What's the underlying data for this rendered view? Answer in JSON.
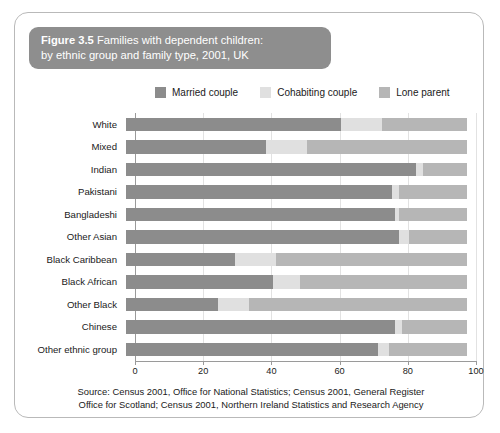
{
  "figure": {
    "number": "Figure 3.5",
    "title_line1": " Families with dependent children:",
    "title_line2": "by ethnic group and family type, 2001, UK",
    "band_color": "#8e8e8e",
    "card_border_color": "#b9b9b9"
  },
  "source": {
    "line1": "Source: Census 2001, Office for National Statistics; Census 2001, General Register",
    "line2": "Office for Scotland; Census 2001, Northern Ireland Statistics and Research Agency"
  },
  "chart_data": {
    "type": "bar",
    "orientation": "horizontal",
    "stacked": true,
    "stack_mode": "percent",
    "title": "Figure 3.5 Families with dependent children: by ethnic group and family type, 2001, UK",
    "xlabel": "",
    "ylabel": "",
    "xlim": [
      0,
      100
    ],
    "xticks": [
      0,
      20,
      40,
      60,
      80,
      100
    ],
    "xtick_labels": [
      "0",
      "20",
      "40",
      "60",
      "80",
      "100"
    ],
    "grid": true,
    "grid_axis": "x",
    "legend_position": "top",
    "categories": [
      "White",
      "Mixed",
      "Indian",
      "Pakistani",
      "Bangladeshi",
      "Other Asian",
      "Black Caribbean",
      "Black African",
      "Other Black",
      "Chinese",
      "Other ethnic group"
    ],
    "series": [
      {
        "name": "Married couple",
        "color": "#8c8c8c",
        "values": [
          63,
          41,
          85,
          78,
          79,
          80,
          32,
          43,
          27,
          79,
          74
        ]
      },
      {
        "name": "Cohabiting couple",
        "color": "#e0e0e0",
        "values": [
          12,
          12,
          2,
          2,
          1,
          3,
          12,
          8,
          9,
          2,
          3
        ]
      },
      {
        "name": "Lone parent",
        "color": "#b6b6b6",
        "values": [
          25,
          47,
          13,
          20,
          20,
          17,
          56,
          49,
          64,
          19,
          23
        ]
      }
    ]
  }
}
